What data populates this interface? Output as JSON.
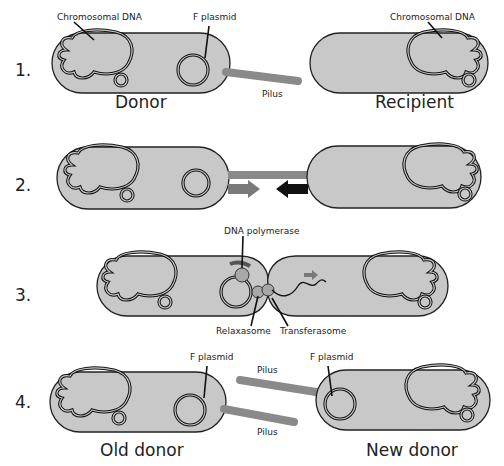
{
  "colors": {
    "cell_fill": "#c8c8c8",
    "outline": "#222222",
    "pilus": "#8a8a8a",
    "arrow_light": "#7a7a7a",
    "arrow_dark": "#111111"
  },
  "steps": [
    {
      "number": "1.",
      "labels": {
        "chromosomal_dna_left": "Chromosomal DNA",
        "f_plasmid": "F plasmid",
        "chromosomal_dna_right": "Chromosomal DNA",
        "pilus": "Pilus",
        "donor": "Donor",
        "recipient": "Recipient"
      }
    },
    {
      "number": "2."
    },
    {
      "number": "3.",
      "labels": {
        "dna_polymerase": "DNA polymerase",
        "relaxasome": "Relaxasome",
        "transferasome": "Transferasome"
      }
    },
    {
      "number": "4.",
      "labels": {
        "f_plasmid_left": "F plasmid",
        "f_plasmid_right": "F plasmid",
        "pilus_top": "Pilus",
        "pilus_bottom": "Pilus",
        "old_donor": "Old donor",
        "new_donor": "New donor"
      }
    }
  ]
}
